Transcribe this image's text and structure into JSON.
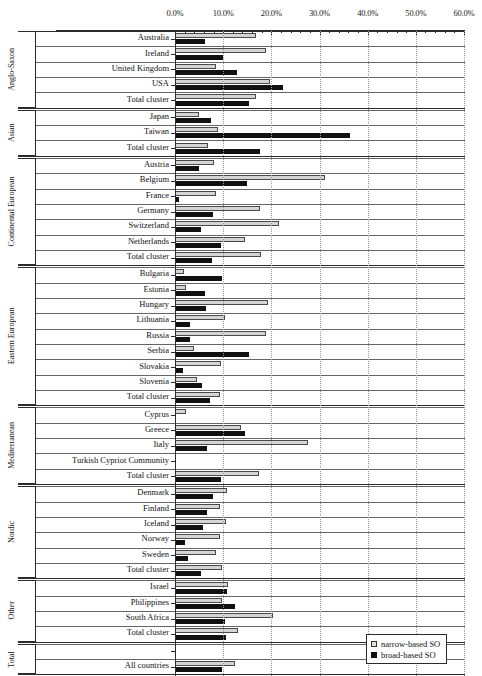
{
  "chart_data": {
    "type": "bar",
    "orientation": "horizontal",
    "title": "",
    "xlabel": "",
    "ylabel": "",
    "xlim": [
      0,
      60
    ],
    "xticks": [
      "0.0%",
      "10.0%",
      "20.0%",
      "30.0%",
      "40.0%",
      "50.0%",
      "60.0%"
    ],
    "xtick_values": [
      0,
      10,
      20,
      30,
      40,
      50,
      60
    ],
    "grid": true,
    "legend_position": "bottom-right",
    "series": [
      {
        "name": "narrow-based SO",
        "color": "#d4d4d4"
      },
      {
        "name": "broad-based SO",
        "color": "#111111"
      }
    ],
    "clusters": [
      {
        "name": "Anglo-Saxon",
        "rows": [
          {
            "label": "Australia",
            "narrow": 16.8,
            "broad": 6.2
          },
          {
            "label": "Ireland",
            "narrow": 18.8,
            "broad": 10.0
          },
          {
            "label": "United Kingdom",
            "narrow": 8.6,
            "broad": 12.8
          },
          {
            "label": "USA",
            "narrow": 19.8,
            "broad": 22.5
          },
          {
            "label": "Total cluster",
            "narrow": 16.8,
            "broad": 15.4
          }
        ]
      },
      {
        "name": "Asian",
        "rows": [
          {
            "label": "Japan",
            "narrow": 5.0,
            "broad": 7.5
          },
          {
            "label": "Taiwan",
            "narrow": 9.0,
            "broad": 36.3
          },
          {
            "label": "Total cluster",
            "narrow": 6.8,
            "broad": 17.6
          }
        ]
      },
      {
        "name": "Continental European",
        "rows": [
          {
            "label": "Austria",
            "narrow": 8.0,
            "broad": 5.0
          },
          {
            "label": "Belgium",
            "narrow": 31.1,
            "broad": 15.0
          },
          {
            "label": "France",
            "narrow": 8.6,
            "broad": 0.9
          },
          {
            "label": "Germany",
            "narrow": 17.6,
            "broad": 7.8
          },
          {
            "label": "Switzerland",
            "narrow": 21.6,
            "broad": 5.5
          },
          {
            "label": "Netherlands",
            "narrow": 14.6,
            "broad": 9.6
          },
          {
            "label": "Total cluster",
            "narrow": 17.8,
            "broad": 7.6
          }
        ]
      },
      {
        "name": "Eastern European",
        "rows": [
          {
            "label": "Bulgaria",
            "narrow": 1.9,
            "broad": 9.8
          },
          {
            "label": "Estonia",
            "narrow": 2.2,
            "broad": 6.2
          },
          {
            "label": "Hungary",
            "narrow": 19.4,
            "broad": 6.4
          },
          {
            "label": "Lithuania",
            "narrow": 10.4,
            "broad": 3.2
          },
          {
            "label": "Russia",
            "narrow": 18.8,
            "broad": 3.2
          },
          {
            "label": "Serbia",
            "narrow": 4.0,
            "broad": 15.4
          },
          {
            "label": "Slovakia",
            "narrow": 9.6,
            "broad": 1.6
          },
          {
            "label": "Slovenia",
            "narrow": 4.6,
            "broad": 5.6
          },
          {
            "label": "Total cluster",
            "narrow": 9.4,
            "broad": 7.2
          }
        ]
      },
      {
        "name": "Mediterranean",
        "rows": [
          {
            "label": "Cyprus",
            "narrow": 2.3,
            "broad": 0.0
          },
          {
            "label": "Greece",
            "narrow": 13.6,
            "broad": 14.6
          },
          {
            "label": "Italy",
            "narrow": 27.6,
            "broad": 6.6
          },
          {
            "label": "Turkish Cypriot Community",
            "narrow": 0.0,
            "broad": 0.0
          },
          {
            "label": "Total cluster",
            "narrow": 17.4,
            "broad": 9.6
          }
        ]
      },
      {
        "name": "Nordic",
        "rows": [
          {
            "label": "Denmark",
            "narrow": 10.8,
            "broad": 7.8
          },
          {
            "label": "Finland",
            "narrow": 9.4,
            "broad": 6.6
          },
          {
            "label": "Iceland",
            "narrow": 10.6,
            "broad": 5.8
          },
          {
            "label": "Norway",
            "narrow": 9.4,
            "broad": 2.0
          },
          {
            "label": "Sweden",
            "narrow": 8.6,
            "broad": 2.6
          },
          {
            "label": "Total cluster",
            "narrow": 9.8,
            "broad": 5.4
          }
        ]
      },
      {
        "name": "Other",
        "rows": [
          {
            "label": "Israel",
            "narrow": 11.0,
            "broad": 10.8
          },
          {
            "label": "Philippines",
            "narrow": 9.8,
            "broad": 12.4
          },
          {
            "label": "South Africa",
            "narrow": 20.4,
            "broad": 10.4
          },
          {
            "label": "Total cluster",
            "narrow": 13.0,
            "broad": 10.6
          }
        ]
      },
      {
        "name": "Total",
        "rows": [
          {
            "label": "",
            "narrow": 0.0,
            "broad": 0.0
          },
          {
            "label": "All countries",
            "narrow": 12.4,
            "broad": 9.8
          }
        ]
      }
    ]
  }
}
